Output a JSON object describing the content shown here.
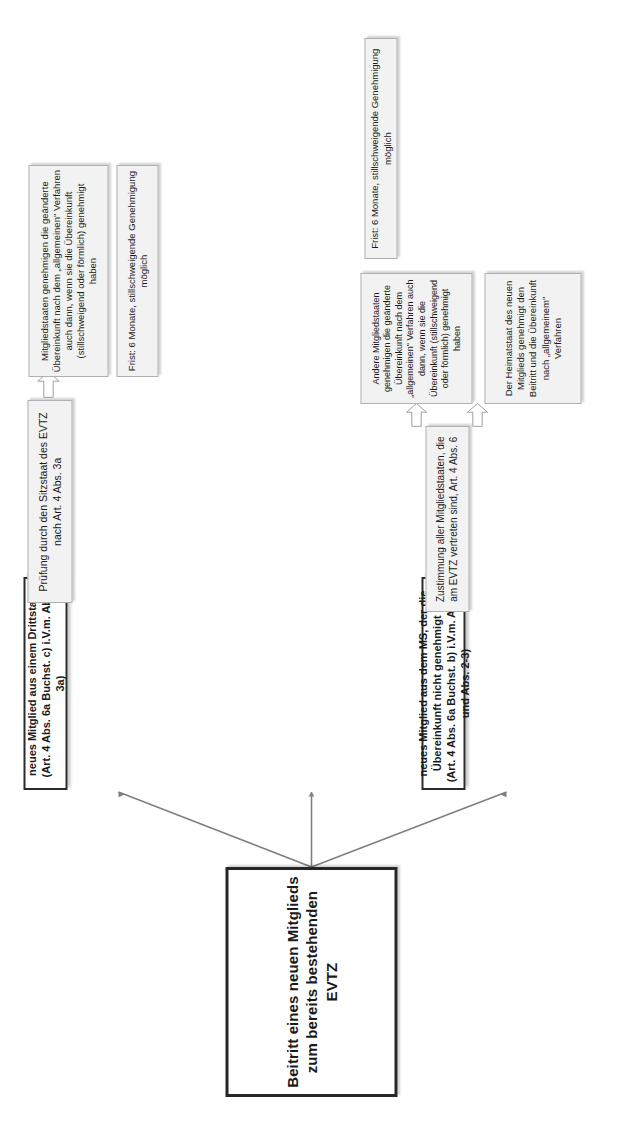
{
  "diagram": {
    "title": "Beitritt eines neuen Mitglieds zum bereits bestehenden EVTZ",
    "orientation": "rotated-90-ccw",
    "branches": [
      {
        "id": "branch-a",
        "entry": "neues Mitglied aus dem MS, der die Übereinkunft bereits genehmigt hat (Art. 4 Abs. 6a Buchst. a))",
        "steps": [
          "Mitteilung des Beitritts an den Sitzstaat des EVTZ",
          "Genehmigung des Beitritts durch den Heimatstaat des neuen Mitglieds"
        ],
        "note": "Frist: 6 Monate, stillschweigende Genehmigung möglich"
      },
      {
        "id": "branch-b",
        "entry": "neues Mitglied aus dem MS, der die Übereinkunft nicht genehmigt hat (Art. 4 Abs. 6a Buchst. b) i.V.m. Abs. 6 und Abs. 2-3)",
        "step1": "Zustimmung aller Mitgliedstaaten, die am EVTZ vertreten sind, Art. 4 Abs. 6",
        "steps": [
          "Andere Mitgliedstaaten genehmigen die geänderte Übereinkunft nach dem „allgemeinen\" Verfahren auch dann, wenn sie die Übereinkunft (stillschweigend oder förmlich) genehmigt haben",
          "Der Heimatstaat des neuen Mitglieds genehmigt den Beitritt und die Übereinkunft nach „allgemeinem\" Verfahren"
        ],
        "note": "Frist: 6 Monate, stillschweigende Genehmigung möglich"
      },
      {
        "id": "branch-c",
        "entry": "neues Mitglied aus einem Drittstaat (Art. 4 Abs. 6a Buchst. c) i.V.m. Abs. 3a)",
        "step1": "Prüfung durch den Sitzstaat des EVTZ nach Art. 4 Abs. 3a",
        "step2": "Mitgliedstaaten genehmigen die geänderte Übereinkunft nach dem „allgemeinen\" Verfahren auch dann, wenn sie die Übereinkunft (stillschweigend oder förmlich) genehmigt haben",
        "note": "Frist: 6 Monate, stillschweigende Genehmigung möglich"
      }
    ],
    "colors": {
      "box_fill": "#f2f2f2",
      "box_border": "#a6a6a6",
      "strong_border": "#2b2b2b",
      "arrow_fill": "#ffffff",
      "arrow_stroke": "#9c9c9c",
      "line": "#7f7f7f",
      "text": "#1a1a1a",
      "page_bg": "#ffffff"
    }
  }
}
